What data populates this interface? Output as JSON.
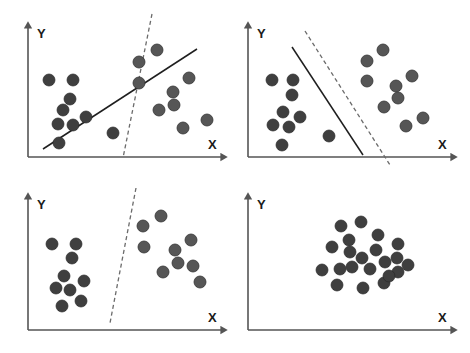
{
  "figure": {
    "title": "",
    "width": 470,
    "height": 353,
    "background": "#ffffff",
    "point_color": "#3f3f3f",
    "point_light_color": "#565656",
    "axis_color": "#555555",
    "solid_line_color": "#1f1f1f",
    "dashed_line_color": "#6b6b6b"
  },
  "chart_data": {
    "type": "scatter",
    "title": "",
    "xlabel": "X",
    "ylabel": "Y",
    "grid": false,
    "legend": "none",
    "panel_count": 4,
    "panels": [
      {
        "id": "panel-top-left",
        "position": "top-left",
        "xlabel": "X",
        "ylabel": "Y",
        "axes": {
          "origin": [
            28,
            157
          ],
          "x_end": [
            222,
            157
          ],
          "y_top": [
            28,
            27
          ]
        },
        "series": [
          {
            "name": "class-a",
            "color": "#3f3f3f",
            "radius": 6,
            "points": [
              [
                49,
                80
              ],
              [
                73,
                80
              ],
              [
                70,
                99
              ],
              [
                63,
                110
              ],
              [
                58,
                124
              ],
              [
                73,
                125
              ],
              [
                86,
                117
              ],
              [
                59,
                143
              ],
              [
                113,
                133
              ]
            ]
          },
          {
            "name": "class-b",
            "color": "#565656",
            "radius": 6,
            "points": [
              [
                157,
                50
              ],
              [
                139,
                62
              ],
              [
                139,
                83
              ],
              [
                189,
                78
              ],
              [
                173,
                92
              ],
              [
                174,
                105
              ],
              [
                159,
                110
              ],
              [
                183,
                128
              ],
              [
                207,
                120
              ]
            ]
          }
        ],
        "separators": [
          {
            "name": "solid-boundary",
            "style": "solid",
            "from": [
              43,
              149
            ],
            "to": [
              197,
              49
            ]
          },
          {
            "name": "dashed-boundary",
            "style": "dashed",
            "from": [
              152,
              14
            ],
            "to": [
              123,
              158
            ]
          }
        ]
      },
      {
        "id": "panel-top-right",
        "position": "top-right",
        "xlabel": "X",
        "ylabel": "Y",
        "axes": {
          "origin": [
            248,
            157
          ],
          "x_end": [
            452,
            157
          ],
          "y_top": [
            248,
            27
          ]
        },
        "series": [
          {
            "name": "class-a",
            "color": "#3f3f3f",
            "radius": 6,
            "points": [
              [
                272,
                80
              ],
              [
                293,
                80
              ],
              [
                292,
                95
              ],
              [
                283,
                112
              ],
              [
                300,
                117
              ],
              [
                273,
                125
              ],
              [
                289,
                127
              ],
              [
                282,
                145
              ],
              [
                329,
                136
              ]
            ]
          },
          {
            "name": "class-b",
            "color": "#565656",
            "radius": 6,
            "points": [
              [
                383,
                50
              ],
              [
                367,
                61
              ],
              [
                367,
                81
              ],
              [
                412,
                76
              ],
              [
                396,
                86
              ],
              [
                398,
                98
              ],
              [
                384,
                107
              ],
              [
                423,
                118
              ],
              [
                406,
                126
              ]
            ]
          }
        ],
        "separators": [
          {
            "name": "solid-boundary",
            "style": "solid",
            "from": [
              292,
              47
            ],
            "to": [
              363,
              155
            ]
          },
          {
            "name": "dashed-boundary",
            "style": "dashed",
            "from": [
              305,
              31
            ],
            "to": [
              390,
              165
            ]
          }
        ]
      },
      {
        "id": "panel-bottom-left",
        "position": "bottom-left",
        "xlabel": "X",
        "ylabel": "Y",
        "axes": {
          "origin": [
            28,
            330
          ],
          "x_end": [
            222,
            330
          ],
          "y_top": [
            28,
            198
          ]
        },
        "series": [
          {
            "name": "class-a",
            "color": "#3f3f3f",
            "radius": 6,
            "points": [
              [
                52,
                244
              ],
              [
                76,
                244
              ],
              [
                72,
                258
              ],
              [
                64,
                276
              ],
              [
                84,
                281
              ],
              [
                56,
                288
              ],
              [
                70,
                290
              ],
              [
                62,
                306
              ],
              [
                81,
                301
              ]
            ]
          },
          {
            "name": "class-b",
            "color": "#565656",
            "radius": 6,
            "points": [
              [
                161,
                216
              ],
              [
                143,
                226
              ],
              [
                144,
                247
              ],
              [
                191,
                240
              ],
              [
                175,
                250
              ],
              [
                178,
                263
              ],
              [
                163,
                272
              ],
              [
                193,
                266
              ],
              [
                200,
                282
              ]
            ]
          }
        ],
        "separators": [
          {
            "name": "dashed-boundary",
            "style": "dashed",
            "from": [
              136,
              188
            ],
            "to": [
              110,
              323
            ]
          }
        ]
      },
      {
        "id": "panel-bottom-right",
        "position": "bottom-right",
        "xlabel": "X",
        "ylabel": "Y",
        "axes": {
          "origin": [
            248,
            330
          ],
          "x_end": [
            452,
            330
          ],
          "y_top": [
            248,
            198
          ]
        },
        "series": [
          {
            "name": "class-mixed",
            "color": "#3f3f3f",
            "radius": 6,
            "points": [
              [
                341,
                226
              ],
              [
                361,
                222
              ],
              [
                349,
                240
              ],
              [
                378,
                235
              ],
              [
                398,
                244
              ],
              [
                332,
                247
              ],
              [
                350,
                252
              ],
              [
                362,
                258
              ],
              [
                322,
                270
              ],
              [
                340,
                269
              ],
              [
                352,
                267
              ],
              [
                370,
                269
              ],
              [
                385,
                262
              ],
              [
                397,
                258
              ],
              [
                398,
                272
              ],
              [
                337,
                285
              ],
              [
                363,
                288
              ],
              [
                384,
                283
              ],
              [
                389,
                276
              ],
              [
                376,
                250
              ],
              [
                408,
                265
              ]
            ]
          }
        ],
        "separators": []
      }
    ]
  }
}
